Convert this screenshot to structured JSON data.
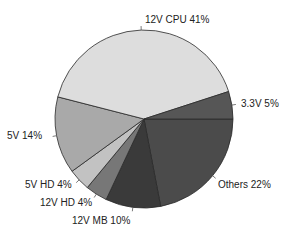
{
  "chart_data": {
    "type": "pie",
    "title": "",
    "start_angle_deg_clockwise_from_east": 0,
    "slices": [
      {
        "label": "Others",
        "value": 22,
        "display": "Others 22%",
        "color": "#4b4b4b"
      },
      {
        "label": "12V MB",
        "value": 10,
        "display": "12V MB 10%",
        "color": "#3a3a3a"
      },
      {
        "label": "12V HD",
        "value": 4,
        "display": "12V HD 4%",
        "color": "#777777"
      },
      {
        "label": "5V HD",
        "value": 4,
        "display": "5V HD 4%",
        "color": "#c2c2c2"
      },
      {
        "label": "5V",
        "value": 14,
        "display": "5V 14%",
        "color": "#a9a9a9"
      },
      {
        "label": "12V CPU",
        "value": 41,
        "display": "12V CPU 41%",
        "color": "#dddddd"
      },
      {
        "label": "3.3V",
        "value": 5,
        "display": "3.3V 5%",
        "color": "#565656"
      }
    ],
    "legend": "none",
    "labels_position": "outside with leader ticks"
  }
}
